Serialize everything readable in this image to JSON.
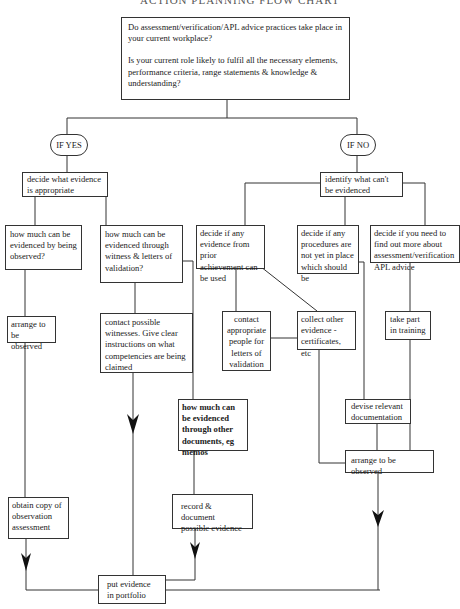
{
  "title": "ACTION PLANNING FLOW CHART",
  "nodes": {
    "start": {
      "q1": "Do assessment/verification/APL advice practices take place in your current workplace?",
      "q2": "Is your current role likely to fulfil all the necessary elements, performance criteria, range statements & knowledge & understanding?"
    },
    "if_yes": "IF YES",
    "if_no": "IF NO",
    "yes_decide": "decide what evidence is appropriate",
    "yes_observed_q": "how much can be evidenced by being observed?",
    "yes_witness_q": "how much can be evidenced through witness & letters of validation?",
    "yes_arrange": "arrange to be observed",
    "yes_contact_witnesses": "contact possible witnesses. Give clear instructions on what competencies are being claimed",
    "yes_documents_q": "how much can be evidenced through other documents, eg memos",
    "yes_record": "record & document possible evidence",
    "yes_obtain_copy": "obtain copy of observation assessment",
    "portfolio": "put evidence in portfolio",
    "no_identify": "identify what can't be evidenced",
    "no_prior": "decide if any evidence from prior achievement can be used",
    "no_procedures": "decide if any procedures are not yet in place which should be",
    "no_find_out": "decide if you need to find out more about assessment/verification APL advice",
    "no_contact_people": "contact appropriate people for letters of validation",
    "no_collect": "collect other evidence - certificates, etc",
    "no_training": "take part in training",
    "no_devise": "devise relevant documentation",
    "no_arrange": "arrange to be observed"
  },
  "colors": {
    "line": "#333333",
    "arrow": "#111111",
    "background": "#ffffff"
  }
}
